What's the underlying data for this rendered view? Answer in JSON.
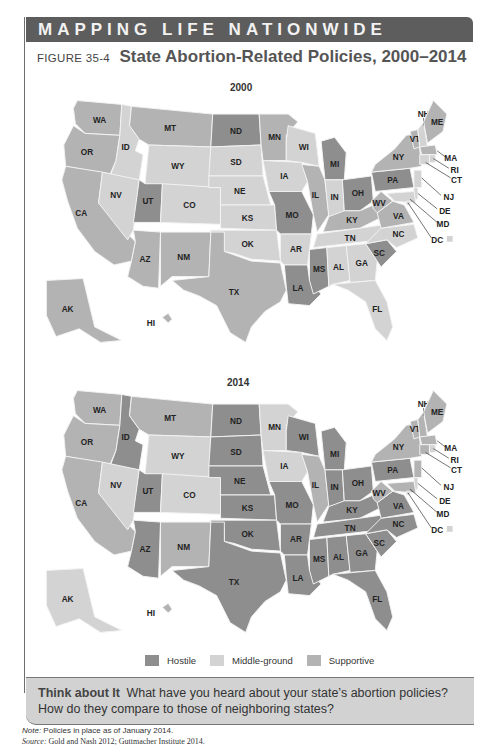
{
  "header": {
    "banner": "MAPPING LIFE NATIONWIDE"
  },
  "figure": {
    "number": "FIGURE 35-4",
    "title": "State Abortion-Related Policies, 2000–2014"
  },
  "colors": {
    "hostile": "#8e8e8e",
    "middle": "#d3d3d3",
    "supportive": "#b3b3b3",
    "border": "#f3f3f3"
  },
  "legend": [
    {
      "key": "hostile",
      "label": "Hostile",
      "color": "#8e8e8e"
    },
    {
      "key": "middle",
      "label": "Middle-ground",
      "color": "#d3d3d3"
    },
    {
      "key": "supportive",
      "label": "Supportive",
      "color": "#b3b3b3"
    }
  ],
  "maps": [
    {
      "year": "2000",
      "policies": {
        "WA": "supportive",
        "OR": "supportive",
        "CA": "supportive",
        "NV": "middle",
        "ID": "middle",
        "MT": "supportive",
        "WY": "middle",
        "UT": "hostile",
        "AZ": "supportive",
        "CO": "middle",
        "NM": "supportive",
        "ND": "hostile",
        "SD": "middle",
        "NE": "middle",
        "KS": "middle",
        "OK": "middle",
        "TX": "supportive",
        "MN": "supportive",
        "IA": "middle",
        "MO": "hostile",
        "AR": "middle",
        "LA": "hostile",
        "WI": "middle",
        "IL": "supportive",
        "MI": "hostile",
        "IN": "middle",
        "OH": "hostile",
        "KY": "supportive",
        "TN": "middle",
        "MS": "hostile",
        "AL": "middle",
        "GA": "middle",
        "FL": "middle",
        "SC": "hostile",
        "NC": "middle",
        "VA": "supportive",
        "WV": "supportive",
        "PA": "hostile",
        "NY": "supportive",
        "VT": "supportive",
        "NH": "middle",
        "ME": "supportive",
        "MA": "supportive",
        "RI": "middle",
        "CT": "middle",
        "NJ": "middle",
        "DE": "middle",
        "MD": "middle",
        "DC": "middle",
        "AK": "supportive",
        "HI": "supportive"
      }
    },
    {
      "year": "2014",
      "policies": {
        "WA": "supportive",
        "OR": "supportive",
        "CA": "supportive",
        "NV": "middle",
        "ID": "hostile",
        "MT": "supportive",
        "WY": "middle",
        "UT": "hostile",
        "AZ": "hostile",
        "CO": "middle",
        "NM": "supportive",
        "ND": "hostile",
        "SD": "hostile",
        "NE": "hostile",
        "KS": "hostile",
        "OK": "hostile",
        "TX": "hostile",
        "MN": "middle",
        "IA": "middle",
        "MO": "hostile",
        "AR": "hostile",
        "LA": "hostile",
        "WI": "hostile",
        "IL": "supportive",
        "MI": "hostile",
        "IN": "hostile",
        "OH": "hostile",
        "KY": "hostile",
        "TN": "hostile",
        "MS": "hostile",
        "AL": "hostile",
        "GA": "hostile",
        "FL": "hostile",
        "SC": "hostile",
        "NC": "hostile",
        "VA": "hostile",
        "WV": "supportive",
        "PA": "hostile",
        "NY": "supportive",
        "VT": "supportive",
        "NH": "supportive",
        "ME": "supportive",
        "MA": "supportive",
        "RI": "middle",
        "CT": "supportive",
        "NJ": "supportive",
        "DE": "middle",
        "MD": "supportive",
        "DC": "middle",
        "AK": "middle",
        "HI": "supportive"
      }
    }
  ],
  "think_about_it": {
    "lead": "Think about It",
    "question": "What have you heard about your state’s abortion policies? How do they compare to those of neighboring states?"
  },
  "notes": {
    "note_label": "Note:",
    "note_text": "Policies in place as of January 2014.",
    "source_label": "Source:",
    "source_text": "Gold and Nash 2012; Guttmacher Institute 2014."
  }
}
